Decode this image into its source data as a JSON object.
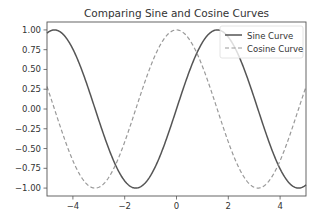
{
  "chart_data": {
    "type": "line",
    "title": "Comparing Sine and Cosine Curves",
    "xlabel": "",
    "ylabel": "",
    "xlim": [
      -5,
      5
    ],
    "ylim": [
      -1.1,
      1.1
    ],
    "grid": false,
    "legend_position": "upper right",
    "x_ticks": [
      -4,
      -2,
      0,
      2,
      4
    ],
    "x_tick_labels": [
      "−4",
      "−2",
      "0",
      "2",
      "4"
    ],
    "y_ticks": [
      1.0,
      0.75,
      0.5,
      0.25,
      0.0,
      -0.25,
      -0.5,
      -0.75,
      -1.0
    ],
    "y_tick_labels": [
      "1.00",
      "0.75",
      "0.50",
      "0.25",
      "0.00",
      "−0.25",
      "−0.50",
      "−0.75",
      "−1.00"
    ],
    "x": [
      -5,
      -4.5,
      -4,
      -3.5,
      -3,
      -2.5,
      -2,
      -1.5,
      -1,
      -0.5,
      0,
      0.5,
      1,
      1.5,
      2,
      2.5,
      3,
      3.5,
      4,
      4.5,
      5
    ],
    "series": [
      {
        "name": "Sine Curve",
        "function": "sin(x)",
        "color": "#555555",
        "style": "solid",
        "values": [
          0.959,
          0.978,
          0.757,
          0.351,
          -0.141,
          -0.598,
          -0.909,
          -0.997,
          -0.841,
          -0.479,
          0.0,
          0.479,
          0.841,
          0.997,
          0.909,
          0.598,
          0.141,
          -0.351,
          -0.757,
          -0.978,
          -0.959
        ]
      },
      {
        "name": "Cosine Curve",
        "function": "cos(x)",
        "color": "#999999",
        "style": "dashed",
        "values": [
          0.284,
          -0.211,
          -0.654,
          -0.936,
          -0.99,
          -0.801,
          -0.416,
          0.071,
          0.54,
          0.878,
          1.0,
          0.878,
          0.54,
          0.071,
          -0.416,
          -0.801,
          -0.99,
          -0.936,
          -0.654,
          -0.211,
          0.284
        ]
      }
    ]
  }
}
